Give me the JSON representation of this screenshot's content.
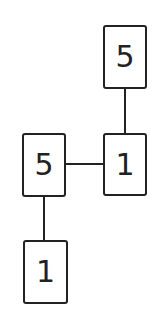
{
  "diagram": {
    "type": "tree",
    "nodes": [
      {
        "id": "n1",
        "label": "5",
        "position": "top-right"
      },
      {
        "id": "n2",
        "label": "1",
        "position": "middle-right"
      },
      {
        "id": "n3",
        "label": "5",
        "position": "middle-left"
      },
      {
        "id": "n4",
        "label": "1",
        "position": "bottom-left"
      }
    ],
    "edges": [
      {
        "from": "n1",
        "to": "n2",
        "orientation": "vertical"
      },
      {
        "from": "n3",
        "to": "n2",
        "orientation": "horizontal"
      },
      {
        "from": "n3",
        "to": "n4",
        "orientation": "vertical"
      }
    ],
    "colors": {
      "stroke": "#222222",
      "background": "#ffffff"
    }
  }
}
